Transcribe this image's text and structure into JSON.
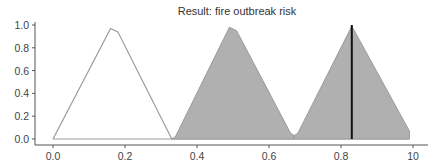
{
  "chart_data": {
    "type": "area",
    "title": "Result: fire outbreak risk",
    "xlabel": "",
    "ylabel": "",
    "xlim": [
      -0.05,
      1.04
    ],
    "ylim": [
      -0.03,
      1.03
    ],
    "x_ticks": [
      0.0,
      0.2,
      0.4,
      0.6,
      0.8,
      1.0
    ],
    "x_tick_labels": [
      "0.0",
      "0.2",
      "0.4",
      "0.6",
      "0.8",
      "10"
    ],
    "y_ticks": [
      0.0,
      0.2,
      0.4,
      0.6,
      0.8,
      1.0
    ],
    "y_tick_labels": [
      "0.0",
      "0.2",
      "0.4",
      "0.6",
      "0.8",
      "1.0"
    ],
    "grid": false,
    "legend": null,
    "series": [
      {
        "name": "low",
        "filled": false,
        "x": [
          0.0,
          0.16,
          0.18,
          0.33
        ],
        "y": [
          0.0,
          0.97,
          0.94,
          0.0
        ]
      },
      {
        "name": "medium",
        "filled": true,
        "x": [
          0.33,
          0.34,
          0.49,
          0.51,
          0.66,
          0.67
        ],
        "y": [
          0.0,
          0.02,
          0.98,
          0.95,
          0.05,
          0.03
        ]
      },
      {
        "name": "high",
        "filled": true,
        "x": [
          0.67,
          0.68,
          0.83,
          0.99,
          0.99
        ],
        "y": [
          0.03,
          0.05,
          0.99,
          0.07,
          0.0
        ]
      }
    ],
    "baseline": {
      "x": [
        0.0,
        0.99
      ],
      "y": [
        0.0,
        0.0
      ]
    },
    "annotations": [
      {
        "type": "vline",
        "x": 0.83,
        "y_range": [
          0.0,
          1.0
        ],
        "color": "#111111",
        "label": "defuzzified result"
      }
    ],
    "colors": {
      "fill": "#b0b0b0",
      "outline": "#9a9a9a",
      "result_line": "#111111",
      "axis": "#555555"
    }
  }
}
